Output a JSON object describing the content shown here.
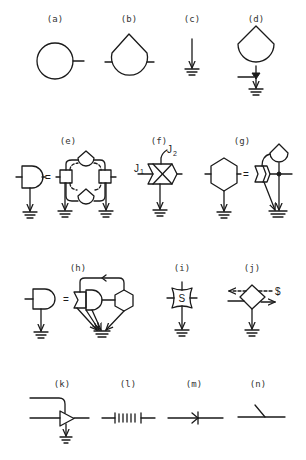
{
  "figure": {
    "panels": [
      {
        "id": "a",
        "label": "(a)",
        "symbol": "energy-source-circle"
      },
      {
        "id": "b",
        "label": "(b)",
        "symbol": "storage-tank"
      },
      {
        "id": "c",
        "label": "(c)",
        "symbol": "heat-sink"
      },
      {
        "id": "d",
        "label": "(d)",
        "symbol": "tank-with-drain"
      },
      {
        "id": "e",
        "label": "(e)",
        "symbol": "consumer-equals-interaction-network"
      },
      {
        "id": "f",
        "label": "(f)",
        "symbol": "multiplier-workgate",
        "inputs": [
          "J1",
          "J2"
        ]
      },
      {
        "id": "g",
        "label": "(g)",
        "symbol": "self-maintaining-hexagon-equivalent"
      },
      {
        "id": "h",
        "label": "(h)",
        "symbol": "consumer-equivalent-with-feedback"
      },
      {
        "id": "i",
        "label": "(i)",
        "symbol": "switch-box",
        "text": "S"
      },
      {
        "id": "j",
        "label": "(j)",
        "symbol": "transaction-diamond",
        "text": "$"
      },
      {
        "id": "k",
        "label": "(k)",
        "symbol": "amplifier-triangle"
      },
      {
        "id": "l",
        "label": "(l)",
        "symbol": "battery-cells"
      },
      {
        "id": "m",
        "label": "(m)",
        "symbol": "diode-one-way-valve"
      },
      {
        "id": "n",
        "label": "(n)",
        "symbol": "open-switch"
      }
    ],
    "glyphs": {
      "j1_main": "J",
      "j1_sub": "1",
      "j2_main": "J",
      "j2_sub": "2",
      "switch_letter": "S",
      "dollar": "$",
      "equals": "="
    },
    "colors": {
      "ink": "#1a1a1a",
      "label": "#333333",
      "background": "#ffffff"
    }
  }
}
